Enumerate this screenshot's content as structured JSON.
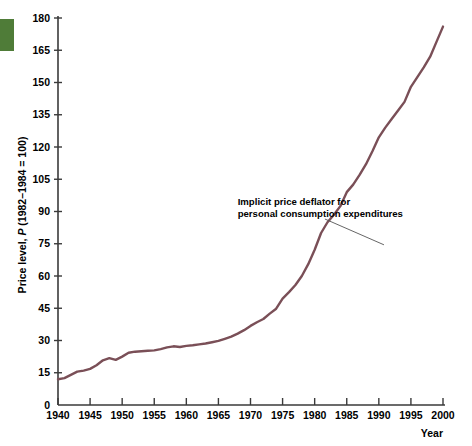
{
  "figure": {
    "green_tab_color": "#4f7c38",
    "line_color": "#7a4f57",
    "axis_color": "#3a3a3a",
    "background_color": "#ffffff"
  },
  "chart_data": {
    "type": "line",
    "title": "",
    "xlabel": "Year",
    "ylabel": "Price level, P (1982–1984 = 100)",
    "ylabel_parts": {
      "prefix": "Price level, ",
      "italic": "P",
      "suffix": " (1982–1984 = 100)"
    },
    "xlim": [
      1940,
      2000
    ],
    "ylim": [
      0,
      180
    ],
    "grid": false,
    "legend": "none",
    "xticks": [
      1940,
      1945,
      1950,
      1955,
      1960,
      1965,
      1970,
      1975,
      1980,
      1985,
      1990,
      1995,
      2000
    ],
    "xtick_labels": [
      "1940",
      "1945",
      "1950",
      "1955",
      "1960",
      "1965",
      "1970",
      "1975",
      "1980",
      "1985",
      "1990",
      "1995",
      "2000"
    ],
    "yticks": [
      0,
      15,
      30,
      45,
      60,
      75,
      90,
      105,
      120,
      135,
      150,
      165,
      180
    ],
    "ytick_labels": [
      "0",
      "15",
      "30",
      "45",
      "60",
      "75",
      "90",
      "105",
      "120",
      "135",
      "150",
      "165",
      "180"
    ],
    "annotations": [
      {
        "name": "series-callout",
        "lines": [
          "Implicit price deflator for",
          "personal consumption expenditures"
        ],
        "text_x": 1968.0,
        "text_y": 93.0,
        "leader_from": [
          1981.6,
          86.5
        ],
        "leader_to": [
          1990.8,
          74.5
        ]
      }
    ],
    "series": [
      {
        "name": "Implicit price deflator for personal consumption expenditures",
        "color": "#7a4f57",
        "x": [
          1940,
          1941,
          1942,
          1943,
          1944,
          1945,
          1946,
          1947,
          1948,
          1949,
          1950,
          1951,
          1952,
          1953,
          1954,
          1955,
          1956,
          1957,
          1958,
          1959,
          1960,
          1961,
          1962,
          1963,
          1964,
          1965,
          1966,
          1967,
          1968,
          1969,
          1970,
          1971,
          1972,
          1973,
          1974,
          1975,
          1976,
          1977,
          1978,
          1979,
          1980,
          1981,
          1982,
          1983,
          1984,
          1985,
          1986,
          1987,
          1988,
          1989,
          1990,
          1991,
          1992,
          1993,
          1994,
          1995,
          1996,
          1997,
          1998,
          1999,
          2000
        ],
        "y": [
          12.2,
          12.6,
          13.6,
          14.6,
          15.2,
          15.7,
          17.2,
          19.3,
          20.9,
          20.6,
          21.0,
          22.4,
          22.9,
          23.2,
          23.4,
          23.5,
          24.0,
          24.7,
          25.2,
          25.6,
          26.0,
          26.3,
          26.6,
          26.9,
          27.3,
          27.8,
          28.5,
          29.3,
          30.5,
          31.9,
          33.4,
          34.9,
          36.2,
          38.4,
          42.4,
          46.0,
          48.7,
          52.0,
          55.9,
          60.8,
          67.3,
          73.4,
          77.8,
          80.9,
          83.8,
          86.5,
          88.0,
          91.1,
          94.8,
          98.8,
          103.5,
          107.4,
          110.8,
          113.8,
          116.5,
          119.3,
          122.4,
          125.0,
          126.8,
          129.5,
          133.6
        ],
        "display_y": [
          12.0,
          12.5,
          14.0,
          15.5,
          16.0,
          16.8,
          18.5,
          20.8,
          21.8,
          21.0,
          22.5,
          24.3,
          24.8,
          25.0,
          25.2,
          25.4,
          26.0,
          26.8,
          27.3,
          27.0,
          27.5,
          27.8,
          28.2,
          28.6,
          29.2,
          29.8,
          30.8,
          31.8,
          33.2,
          34.8,
          36.8,
          38.5,
          40.0,
          42.5,
          44.8,
          49.5,
          52.5,
          55.8,
          60.0,
          65.5,
          72.2,
          80.0,
          85.0,
          88.5,
          92.5,
          99.0,
          102.5,
          107.0,
          112.0,
          118.0,
          124.5,
          129.0,
          133.0,
          137.0,
          141.0,
          148.0,
          152.5,
          157.0,
          162.0,
          169.0,
          176.0
        ]
      }
    ]
  }
}
